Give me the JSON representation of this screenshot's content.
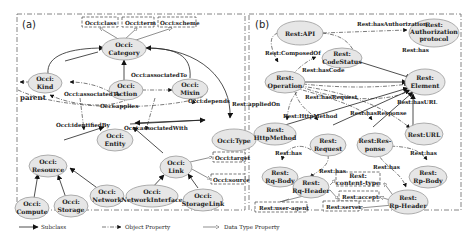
{
  "panels": {
    "a": {
      "label": "(a)"
    },
    "b": {
      "label": "(b)"
    }
  },
  "occi": {
    "datatype_boxes": {
      "class": "Occi:class",
      "term": "Occi:term",
      "scheme": "Occi:scheme",
      "target": "Occi:target",
      "source": "Occi:source"
    },
    "nodes": {
      "category": [
        "Occi:",
        "Category"
      ],
      "kind": [
        "Occi:",
        "Kind"
      ],
      "action": [
        "Occi:",
        "Action"
      ],
      "mixin": [
        "Occi:",
        "Mixin"
      ],
      "entity": [
        "Occi:",
        "Entity"
      ],
      "type": "Occi:Type",
      "resource": [
        "Occi:",
        "Resource"
      ],
      "link": [
        "Occi:",
        "Link"
      ],
      "compute": [
        "Occi:",
        "Compute"
      ],
      "storage": [
        "Occi:",
        "Storage"
      ],
      "network": [
        "Occi:",
        "Network"
      ],
      "networkinterface": [
        "Occi:",
        "NetworkInterface"
      ],
      "storagelink": [
        "Occi:",
        "StorageLink"
      ]
    },
    "edges": {
      "associatedTo_top": "Occi:associatedTo",
      "associatedTo_left": "Occi:associatedTo",
      "applies": "Occi:applies",
      "depends": "Occi:depends",
      "parent": "parent",
      "identifiedBy": "Occi:identifiedBy",
      "associatedWith": "Occi:associatedWith"
    }
  },
  "rest": {
    "nodes": {
      "api": "Rest:API",
      "auth": [
        "Rest:",
        "Authorization",
        "protocol"
      ],
      "codestatus": [
        "Rest:",
        "CodeStatus"
      ],
      "operation": [
        "Rest:",
        "Operation"
      ],
      "element": [
        "Rest:",
        "Element"
      ],
      "httpmethod": [
        "Rest:",
        "HttpMethod"
      ],
      "request": [
        "Rest:",
        "Request"
      ],
      "response": [
        "Rest:Res-",
        "ponse"
      ],
      "url": "Rest:URL",
      "rqbody": [
        "Rest:",
        "Rq-Body"
      ],
      "rqheader": [
        "Rest:",
        "Rq-Header"
      ],
      "rpbody": [
        "Rest:",
        "Rp-Body"
      ],
      "rpheader": [
        "Rest:",
        "Rp-Header"
      ]
    },
    "datatype_boxes": {
      "contenttype": [
        "Rest:",
        "content-type"
      ],
      "accept": "Rest:accept",
      "useragent": "Rest:user-agent",
      "server": "Rest:server"
    },
    "edges": {
      "hasAuthorization": "Rest:hasAuthorization",
      "composedOf": "Rest:ComposedOf",
      "has_api": "Rest:has",
      "hasCode": "Rest:hasCode",
      "appliedOn": "Rest:appliedOn",
      "hasRequest": "Rest:hasRequest",
      "hasHttpMethod": "Rest:HttpMethod",
      "hasResponse": "Rest:hasResponse",
      "hasURL": "Rest:hasURL",
      "has_req": "Rest:has",
      "has_rqheader": "Rest:has",
      "has_resp": "Rest:has",
      "has_rp": "Rest:has"
    }
  },
  "legend": {
    "subclass": "Subclass",
    "object_property": "Object Property",
    "data_type_property": "Data Type Property"
  }
}
